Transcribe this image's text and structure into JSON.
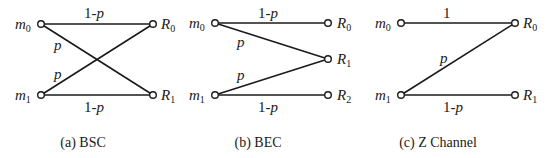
{
  "diagrams": [
    {
      "id": "bsc",
      "caption": "(a) BSC",
      "inputs": [
        {
          "name": "m",
          "sub": "0"
        },
        {
          "name": "m",
          "sub": "1"
        }
      ],
      "outputs": [
        {
          "name": "R",
          "sub": "0"
        },
        {
          "name": "R",
          "sub": "1"
        }
      ],
      "edges": [
        {
          "from": "m0",
          "to": "R0",
          "label": "1-p"
        },
        {
          "from": "m0",
          "to": "R1",
          "label": "p"
        },
        {
          "from": "m1",
          "to": "R0",
          "label": "p"
        },
        {
          "from": "m1",
          "to": "R1",
          "label": "1-p"
        }
      ],
      "labels": {
        "top": "1-",
        "top_p": "p",
        "cross1": "p",
        "cross2": "p",
        "bottom": "1-",
        "bottom_p": "p"
      }
    },
    {
      "id": "bec",
      "caption": "(b) BEC",
      "inputs": [
        {
          "name": "m",
          "sub": "0"
        },
        {
          "name": "m",
          "sub": "1"
        }
      ],
      "outputs": [
        {
          "name": "R",
          "sub": "0"
        },
        {
          "name": "R",
          "sub": "1"
        },
        {
          "name": "R",
          "sub": "2"
        }
      ],
      "edges": [
        {
          "from": "m0",
          "to": "R0",
          "label": "1-p"
        },
        {
          "from": "m0",
          "to": "R1",
          "label": "p"
        },
        {
          "from": "m1",
          "to": "R1",
          "label": "p"
        },
        {
          "from": "m1",
          "to": "R2",
          "label": "1-p"
        }
      ],
      "labels": {
        "top": "1-",
        "top_p": "p",
        "cross1": "p",
        "cross2": "p",
        "bottom": "1-",
        "bottom_p": "p"
      }
    },
    {
      "id": "z",
      "caption": "(c) Z Channel",
      "inputs": [
        {
          "name": "m",
          "sub": "0"
        },
        {
          "name": "m",
          "sub": "1"
        }
      ],
      "outputs": [
        {
          "name": "R",
          "sub": "0"
        },
        {
          "name": "R",
          "sub": "1"
        }
      ],
      "edges": [
        {
          "from": "m0",
          "to": "R0",
          "label": "1"
        },
        {
          "from": "m1",
          "to": "R0",
          "label": "p"
        },
        {
          "from": "m1",
          "to": "R1",
          "label": "1-p"
        }
      ],
      "labels": {
        "top": "1",
        "cross1": "p",
        "bottom": "1-",
        "bottom_p": "p"
      }
    }
  ]
}
